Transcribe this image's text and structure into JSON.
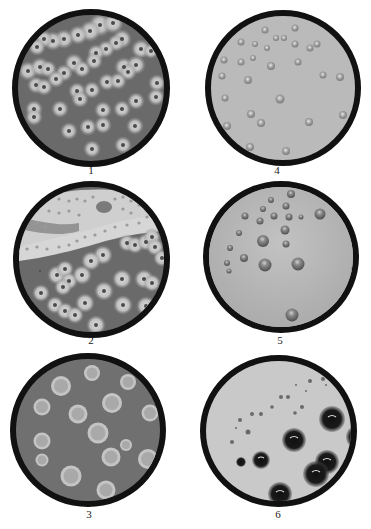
{
  "figure": {
    "background": "#ffffff",
    "rim_color": "#111111",
    "plates": [
      {
        "id": 1,
        "label": "1",
        "cx": 91,
        "cy": 88,
        "r": 79,
        "agar": "#6a6a6a",
        "label_x": 84,
        "label_y": 165,
        "description": "dark agar with small colonies surrounded by pale halos, some confluent"
      },
      {
        "id": 2,
        "label": "2",
        "cx": 91,
        "cy": 259,
        "r": 78,
        "agar": "#6a6a6a",
        "label_x": 84,
        "label_y": 335,
        "description": "dark agar with a pale confluent band of colonies across the top and isolated haloed colonies below"
      },
      {
        "id": 3,
        "label": "3",
        "cx": 88,
        "cy": 430,
        "r": 78,
        "agar": "#707070",
        "label_x": 81,
        "label_y": 509,
        "description": "dark agar with large pale circular colonies with ring zones"
      },
      {
        "id": 4,
        "label": "4",
        "cx": 283,
        "cy": 88,
        "r": 78,
        "agar": "#b9b9b9",
        "label_x": 267,
        "label_y": 165,
        "description": "light agar with small translucent dome-shaped colonies"
      },
      {
        "id": 5,
        "label": "5",
        "cx": 280,
        "cy": 258,
        "r": 78,
        "agar": "#b4b4b4",
        "label_x": 270,
        "label_y": 335,
        "description": "light agar with glossy grey dome colonies of varied sizes"
      },
      {
        "id": 6,
        "label": "6",
        "cx": 278,
        "cy": 430,
        "r": 78,
        "agar": "#c8c8c8",
        "label_x": 268,
        "label_y": 509,
        "description": "light agar with very dark black colonies and tiny specks"
      }
    ]
  }
}
